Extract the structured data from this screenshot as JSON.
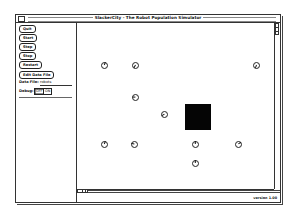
{
  "window": {
    "title": "SlackerCity - The Robot Population Simulator"
  },
  "controls": {
    "buttons": [
      {
        "label": "Quit"
      },
      {
        "label": "Start"
      },
      {
        "label": "Step"
      },
      {
        "label": "Stop"
      },
      {
        "label": "Restart"
      },
      {
        "label": "Edit Data File"
      }
    ],
    "data_file_label": "Data File:",
    "data_file_value": "robots",
    "debug_label": "Debug:",
    "debug_options": [
      "OFF",
      "ON"
    ],
    "debug_selected": "OFF"
  },
  "simulation": {
    "robots": [
      {
        "id": 1,
        "heading_deg": 200
      },
      {
        "id": 2,
        "heading_deg": 30
      },
      {
        "id": 3,
        "heading_deg": 90
      },
      {
        "id": 4,
        "heading_deg": 60
      },
      {
        "id": 5,
        "heading_deg": 20
      },
      {
        "id": 6,
        "heading_deg": 200
      },
      {
        "id": 7,
        "heading_deg": 100
      },
      {
        "id": 8,
        "heading_deg": 180
      },
      {
        "id": 9,
        "heading_deg": 240
      },
      {
        "id": 10,
        "heading_deg": 180
      }
    ],
    "obstacles": 1
  },
  "footer": {
    "version": "version 1.00"
  }
}
